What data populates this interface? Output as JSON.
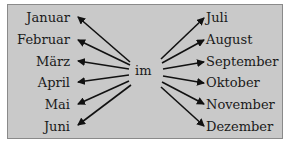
{
  "diagram": {
    "center_label": "im",
    "left_months": [
      "Januar",
      "Februar",
      "März",
      "April",
      "Mai",
      "Juni"
    ],
    "right_months": [
      "Juli",
      "August",
      "September",
      "Oktober",
      "November",
      "Dezember"
    ],
    "colors": {
      "background": "#c9c9c9",
      "border": "#8a8a8a",
      "text": "#1a1a1a",
      "arrow": "#111111"
    }
  }
}
